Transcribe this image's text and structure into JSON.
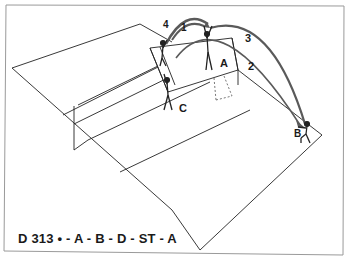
{
  "diagram": {
    "caption": "D 313  • - A - B - D - ST - A",
    "player_labels": {
      "a": "A",
      "b": "B",
      "c": "C"
    },
    "path_labels": {
      "p1": "1",
      "p2": "2",
      "p3": "3",
      "p4": "4"
    },
    "colors": {
      "line": "#222222",
      "arc": "#5a5a5a",
      "frame": "#9a9a9a",
      "background": "#ffffff"
    }
  }
}
